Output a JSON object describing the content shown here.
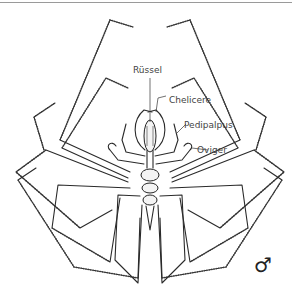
{
  "figure": {
    "labels": {
      "proboscis": "Rüssel",
      "chelicere": "Chelicere",
      "pedipalpus": "Pedipalpus",
      "oviger": "Oviger"
    },
    "sex_symbol": "♂",
    "colors": {
      "line": "#2a2a2a",
      "label_text": "#444444",
      "background": "#ffffff",
      "top_rule": "#9a9a9a"
    }
  }
}
